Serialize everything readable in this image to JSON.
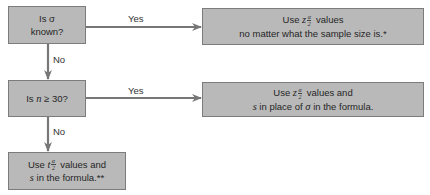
{
  "diagram": {
    "type": "flowchart",
    "colors": {
      "box_fill": "#b9b9b9",
      "box_border": "#7c7c7c",
      "arrow": "#777777"
    },
    "decisions": [
      {
        "id": "sigma_known",
        "text_prefix": "Is ",
        "symbol": "σ",
        "text_line2": "known?"
      },
      {
        "id": "n_ge_30",
        "text_prefix": "Is ",
        "symbol": "n",
        "text_suffix": " ≥ 30?"
      }
    ],
    "outcomes": [
      {
        "id": "use_z_any",
        "line1_prefix": "Use ",
        "var": "z",
        "frac_num": "α",
        "frac_den": "2",
        "line1_suffix": " values",
        "line2": "no matter what the sample size is.*"
      },
      {
        "id": "use_z_s",
        "line1_prefix": "Use ",
        "var": "z",
        "frac_num": "α",
        "frac_den": "2",
        "line1_suffix": " values and",
        "line2_var": "s",
        "line2_mid": " in place of ",
        "line2_sym": "σ",
        "line2_suffix": " in the formula."
      },
      {
        "id": "use_t_s",
        "line1_prefix": "Use ",
        "var": "t",
        "frac_num": "α",
        "frac_den": "2",
        "line1_suffix": " values and",
        "line2_var": "s",
        "line2_suffix": " in the formula.**"
      }
    ],
    "edges": [
      {
        "from": "sigma_known",
        "to": "use_z_any",
        "label": "Yes"
      },
      {
        "from": "sigma_known",
        "to": "n_ge_30",
        "label": "No"
      },
      {
        "from": "n_ge_30",
        "to": "use_z_s",
        "label": "Yes"
      },
      {
        "from": "n_ge_30",
        "to": "use_t_s",
        "label": "No"
      }
    ]
  }
}
